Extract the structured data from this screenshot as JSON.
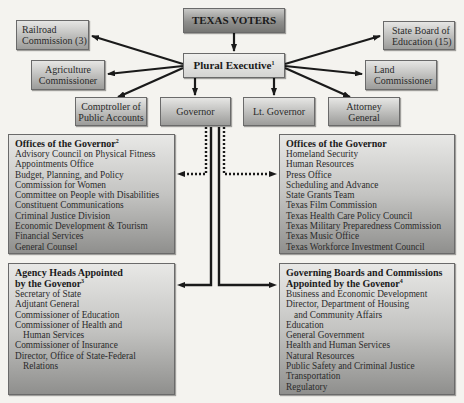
{
  "top": {
    "voters": "TEXAS VOTERS",
    "plural_executive": "Plural Executive",
    "plural_executive_note": "1"
  },
  "offices": {
    "railroad": [
      "Railroad",
      "Commission (3)"
    ],
    "agriculture": [
      "Agriculture",
      "Commissioner"
    ],
    "comptroller": [
      "Comptroller of",
      "Public Accounts"
    ],
    "governor": "Governor",
    "lt_governor": "Lt. Governor",
    "attorney": [
      "Attorney",
      "General"
    ],
    "land": [
      "Land",
      "Commissioner"
    ],
    "sboe": [
      "State Board of",
      "Education (15)"
    ]
  },
  "offices_left": {
    "title": "Offices of the Governor",
    "note": "2",
    "items": [
      "Advisory Council on Physical Fitness",
      "Appointments Office",
      "Budget, Planning, and Policy",
      "Commission for Women",
      "Committee on People with Disabilities",
      "Constituent Communications",
      "Criminal Justice Division",
      "Economic Development & Tourism",
      "Financial Services",
      "General Counsel"
    ]
  },
  "offices_right": {
    "title": "Offices of the Governor",
    "items": [
      "Homeland Security",
      "Human Resources",
      "Press Office",
      "Scheduling and Advance",
      "State Grants Team",
      "Texas Film Commission",
      "Texas Health Care Policy Council",
      "Texas Military Preparedness Commission",
      "Texas Music Office",
      "Texas Workforce Investment Council"
    ]
  },
  "agency_heads": {
    "title_line1": "Agency Heads Appointed",
    "title_line2": "by the Govenor",
    "note": "3",
    "items": [
      "Secretary of State",
      "Adjutant General",
      "Commissioner of Education",
      "Commissioner of Health and",
      "Human Services",
      "Commissioner of Insurance",
      "Director, Office of State-Federal",
      "Relations"
    ]
  },
  "boards": {
    "title_line1": "Governing Boards and Commissions",
    "title_line2": "Appointed by the Govenor",
    "note": "4",
    "items": [
      "Business and Economic Development",
      "Director, Department of Housing",
      "and Community Affairs",
      "Education",
      "General Government",
      "Health and Human Services",
      "Natural Resources",
      "Public Safety and Criminal Justice",
      "Transportation",
      "Regulatory"
    ]
  }
}
